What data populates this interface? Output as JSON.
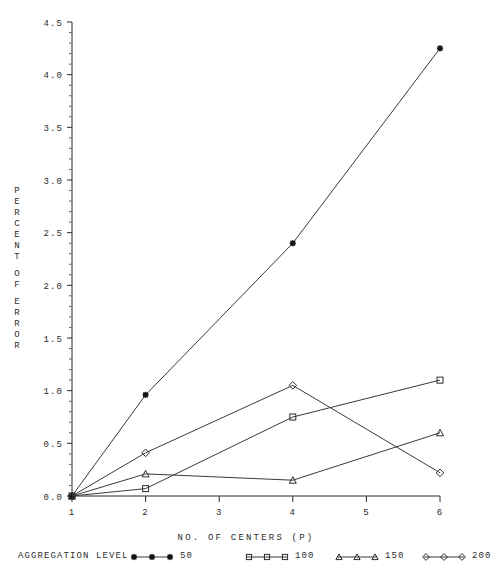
{
  "chart_data": {
    "type": "line",
    "title": "",
    "xlabel": "NO. OF CENTERS (P)",
    "ylabel": "PERCENT OF ERROR",
    "ylabel_chars": [
      "P",
      "E",
      "R",
      "C",
      "E",
      "N",
      "T",
      "",
      "O",
      "F",
      "",
      "E",
      "R",
      "R",
      "O",
      "R"
    ],
    "x": [
      1,
      2,
      4,
      6
    ],
    "xlim": [
      1,
      6
    ],
    "ylim": [
      0.0,
      4.5
    ],
    "xticks": [
      "1",
      "2",
      "3",
      "4",
      "5",
      "6"
    ],
    "yticks": [
      "0.0",
      "0.5",
      "1.0",
      "1.5",
      "2.0",
      "2.5",
      "3.0",
      "3.5",
      "4.0",
      "4.5"
    ],
    "minor_ticks_per_interval": 5,
    "grid": false,
    "legend_position": "below",
    "legend_title": "AGGREGATION LEVEL",
    "series": [
      {
        "name": "50",
        "marker": "filled-star",
        "values": [
          0.0,
          0.96,
          2.4,
          4.25
        ]
      },
      {
        "name": "100",
        "marker": "square",
        "values": [
          0.0,
          0.07,
          0.75,
          1.1
        ]
      },
      {
        "name": "150",
        "marker": "triangle",
        "values": [
          0.0,
          0.21,
          0.15,
          0.6
        ]
      },
      {
        "name": "200",
        "marker": "diamond",
        "values": [
          0.0,
          0.41,
          1.05,
          0.22
        ]
      }
    ]
  },
  "legend": {
    "title": "AGGREGATION LEVEL",
    "entries": [
      {
        "label": "50",
        "marker": "filled-star"
      },
      {
        "label": "100",
        "marker": "square"
      },
      {
        "label": "150",
        "marker": "triangle"
      },
      {
        "label": "200",
        "marker": "diamond"
      }
    ]
  }
}
